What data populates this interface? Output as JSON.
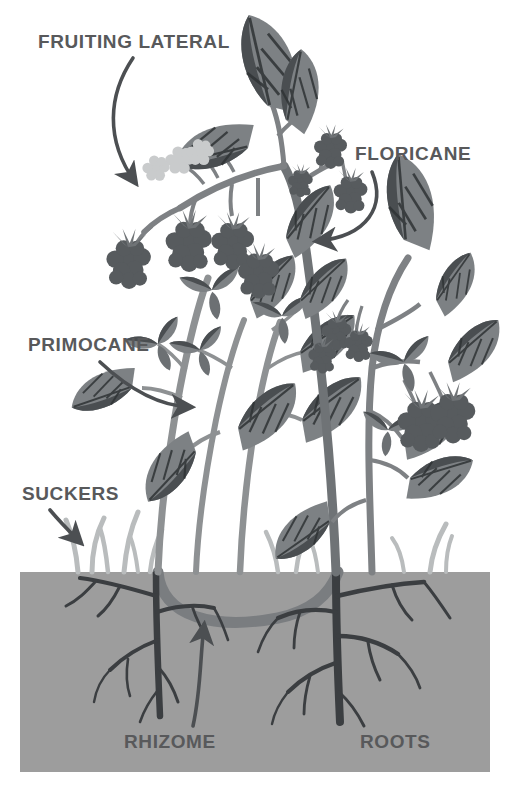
{
  "diagram": {
    "type": "botanical-illustration",
    "canvas": {
      "width": 511,
      "height": 793
    },
    "background_color": "#ffffff"
  },
  "palette": {
    "background": "#ffffff",
    "soil": "#9d9d9d",
    "soil_shadow": "#949494",
    "label_text": "#58595b",
    "arrow": "#4c4f52",
    "cane_light": "#8e9193",
    "cane_mid": "#7e8184",
    "cane_dark": "#6f7376",
    "leaf_light": "#7d8184",
    "leaf_dark": "#4a4e51",
    "berry_ripe": "#575b5e",
    "berry_unripe": "#c9cbcc",
    "root": "#3b3e41",
    "sucker": "#b9bcbd",
    "rhizome": "#7a7d80"
  },
  "labels": [
    {
      "id": "fruiting-lateral",
      "text": "FRUITING LATERAL",
      "x": 38,
      "y": 48,
      "anchor": "start",
      "font_size": 19
    },
    {
      "id": "floricane",
      "text": "FLORICANE",
      "x": 355,
      "y": 160,
      "anchor": "start",
      "font_size": 19
    },
    {
      "id": "primocane",
      "text": "PRIMOCANE",
      "x": 28,
      "y": 351,
      "anchor": "start",
      "font_size": 19
    },
    {
      "id": "suckers",
      "text": "SUCKERS",
      "x": 22,
      "y": 500,
      "anchor": "start",
      "font_size": 19
    },
    {
      "id": "rhizome",
      "text": "RHIZOME",
      "x": 124,
      "y": 748,
      "anchor": "start",
      "font_size": 19
    },
    {
      "id": "roots",
      "text": "ROOTS",
      "x": 360,
      "y": 748,
      "anchor": "start",
      "font_size": 19
    }
  ],
  "annotations": {
    "arrows": [
      {
        "id": "arrow-fruiting-lateral",
        "from_label": "fruiting-lateral",
        "points_to": "berry cluster on fruiting lateral",
        "curve": "M133,58 C108,95 105,140 135,182",
        "head_angle": 55
      },
      {
        "id": "arrow-floricane",
        "from_label": "floricane",
        "points_to": "floricane cane",
        "curve": "M372,172 C385,205 368,236 315,241",
        "head_angle": 188
      },
      {
        "id": "arrow-primocane",
        "from_label": "primocane",
        "points_to": "primocane cane",
        "curve": "M100,362 C130,392 160,406 190,407",
        "head_angle": 5
      },
      {
        "id": "arrow-suckers",
        "from_label": "suckers",
        "points_to": "sucker shoots",
        "curve": "M52,511 C62,524 72,534 81,543",
        "head_angle": 45
      },
      {
        "id": "arrow-rhizome",
        "from_label": "rhizome",
        "points_to": "underground rhizome",
        "curve": "M193,725 C200,690 200,660 204,624",
        "head_angle": 274
      }
    ]
  },
  "soil": {
    "name": "soil-block",
    "x": 20,
    "y": 572,
    "width": 470,
    "height": 200,
    "color": "#9d9d9d",
    "surface_line_y": 572
  },
  "plant_structures": [
    {
      "name": "floricane",
      "description": "Second-year fruit-bearing cane, thick arching stem bearing fruiting laterals with ripe and unripe berries",
      "color": "#6f7376"
    },
    {
      "name": "primocane",
      "description": "First-year vegetative cane with leaves only, no fruit",
      "color": "#8e9193"
    },
    {
      "name": "fruiting-lateral",
      "description": "Side branch off the floricane carrying the berry cluster",
      "color": "#7e8184"
    },
    {
      "name": "suckers",
      "description": "Small shoots emerging from the rhizome near the soil surface",
      "color": "#b9bcbd"
    },
    {
      "name": "rhizome",
      "description": "Horizontal underground stem connecting the canes",
      "color": "#7a7d80"
    },
    {
      "name": "roots",
      "description": "Branching fibrous root system below the soil line",
      "color": "#3b3e41"
    }
  ],
  "berries": {
    "ripe_count": 12,
    "unripe_count": 3,
    "ripe_color": "#575b5e",
    "unripe_color": "#c9cbcc"
  }
}
